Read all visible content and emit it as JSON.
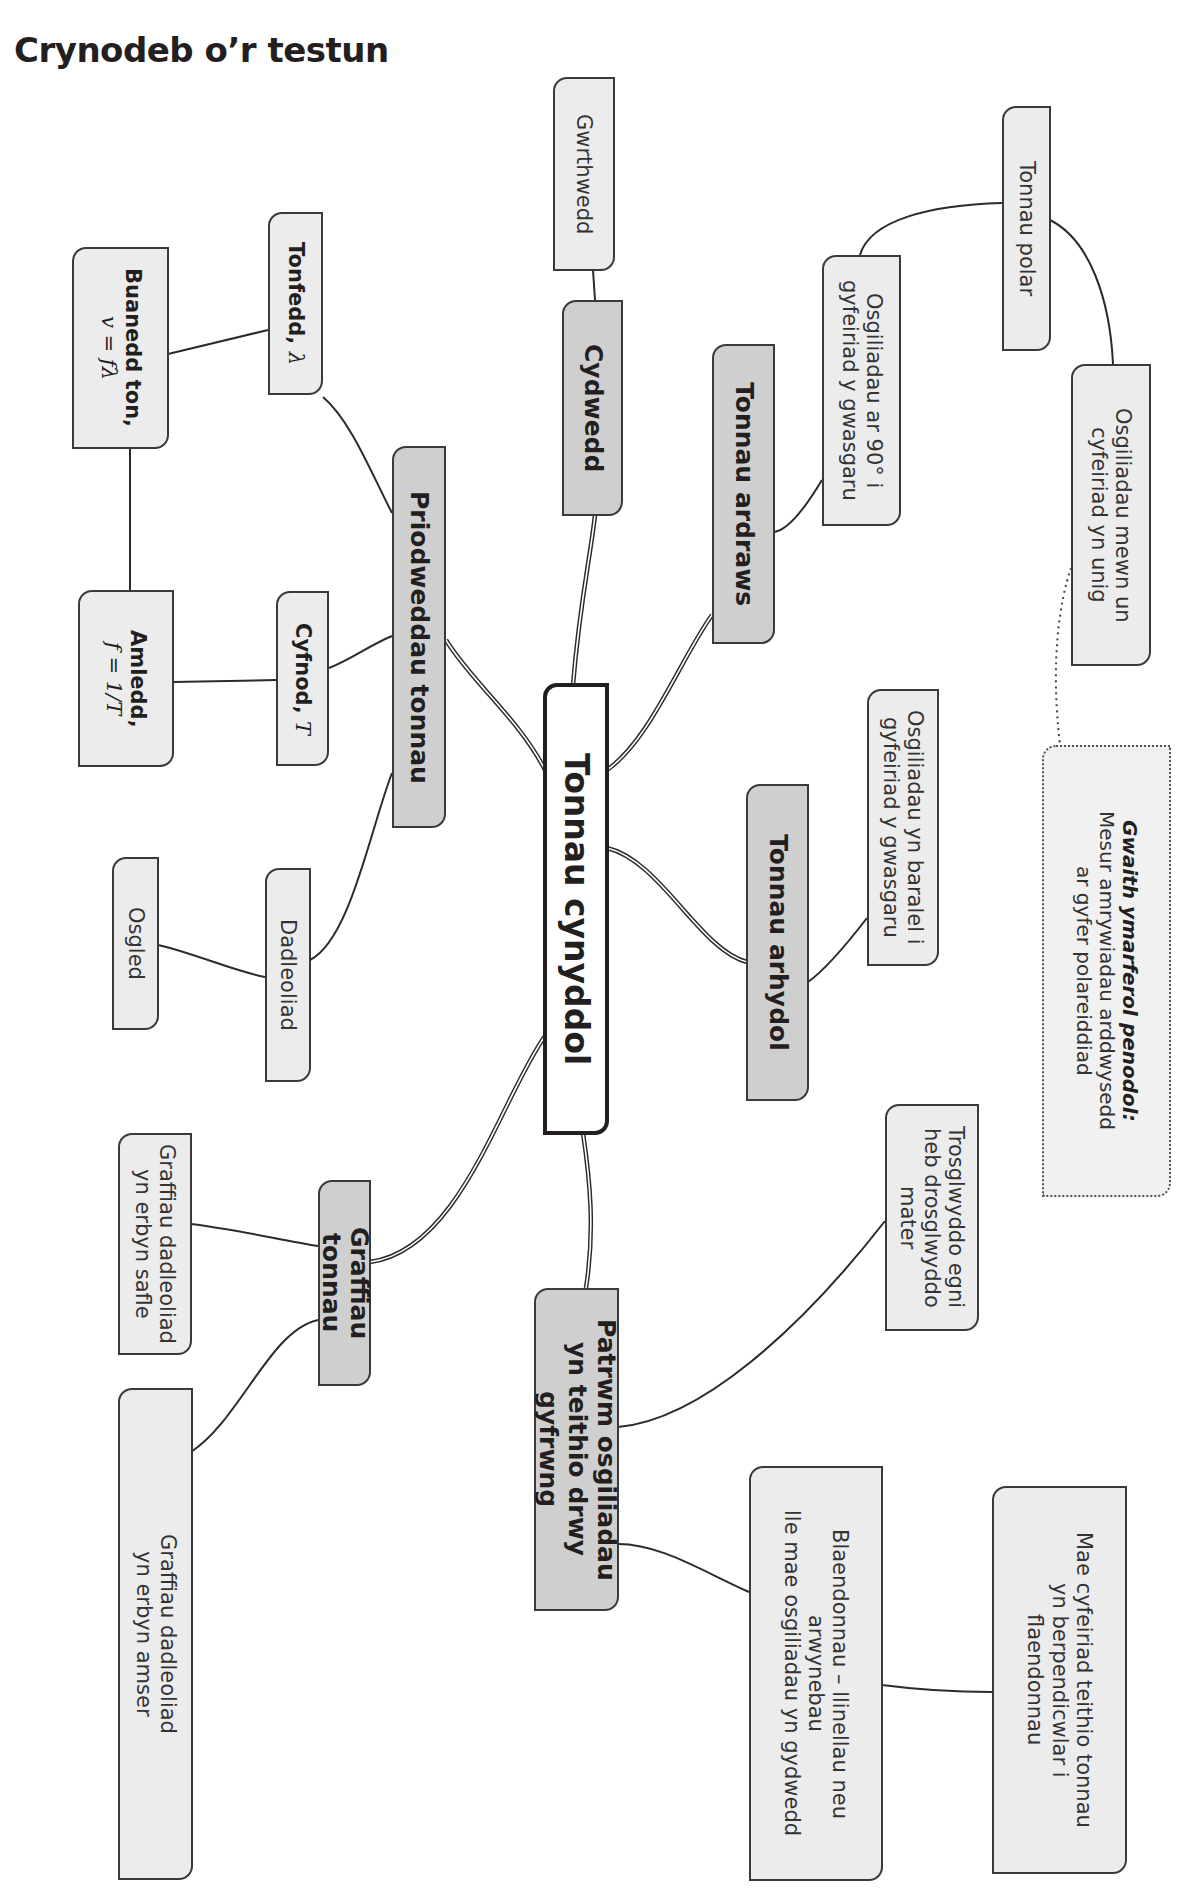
{
  "page": {
    "title": "Crynodeb o’r testun"
  },
  "mindmap": {
    "center": {
      "label": "Tonnau cynyddol"
    },
    "branches": {
      "properties": {
        "label": "Priodweddau tonnau"
      },
      "superposition": {
        "label": "Cydwedd"
      },
      "transverse": {
        "label": "Tonnau ardraws"
      },
      "longitudinal": {
        "label": "Tonnau arhydol"
      },
      "graphs": {
        "label": "Graffiau tonnau"
      },
      "pattern": {
        "line1": "Patrwm osgiliadau",
        "line2": "yn teithio drwy gyfrwng"
      }
    },
    "leaves": {
      "antiphase": {
        "label": "Gwrthwedd"
      },
      "wavelength": {
        "label": "Tonfedd,",
        "symbol": "λ"
      },
      "wave_speed": {
        "label": "Buanedd ton,",
        "formula": "v = fλ"
      },
      "frequency": {
        "label": "Amledd,",
        "formula_lhs": "f =",
        "formula_num": "1",
        "formula_den": "T"
      },
      "period": {
        "label": "Cyfnod,",
        "symbol": "T"
      },
      "displacement": {
        "label": "Dadleoliad"
      },
      "amplitude": {
        "label": "Osgled"
      },
      "polarised": {
        "label": "Tonnau polar"
      },
      "transverse_desc": {
        "line1": "Osgiliadau ar 90° i",
        "line2": "gyfeiriad y gwasgaru"
      },
      "polarised_desc": {
        "line1": "Osgiliadau mewn un",
        "line2": "cyfeiriad yn unig"
      },
      "longitudinal_desc": {
        "line1": "Osgiliadau yn baralel i",
        "line2": "gyfeiriad y gwasgaru"
      },
      "energy_transfer": {
        "line1": "Trosglwyddo egni",
        "line2": "heb drosglwyddo mater"
      },
      "wavefronts": {
        "line1": "Blaendonnau – llinellau neu",
        "line2": "arwynebau",
        "line3": "lle mae osgiliadau yn gydwedd"
      },
      "direction": {
        "line1": "Mae cyfeiriad teithio tonnau",
        "line2": "yn berpendicwlar i",
        "line3": "flaendonnau"
      },
      "graph_position": {
        "line1": "Graffiau dadleoliad",
        "line2": "yn erbyn safle"
      },
      "graph_time": {
        "line1": "Graffiau dadleoliad",
        "line2": "yn erbyn amser"
      }
    },
    "practical_note": {
      "heading": "Gwaith ymarferol penodol:",
      "line1": "Mesur amrywiadau arddwysedd",
      "line2": "ar gyfer polareiddiad"
    }
  },
  "colors": {
    "center_fill": "#ffffff",
    "branch_fill": "#cfcfcf",
    "leaf_fill": "#ececec",
    "border": "#3a3a3a",
    "text": "#231f20"
  }
}
